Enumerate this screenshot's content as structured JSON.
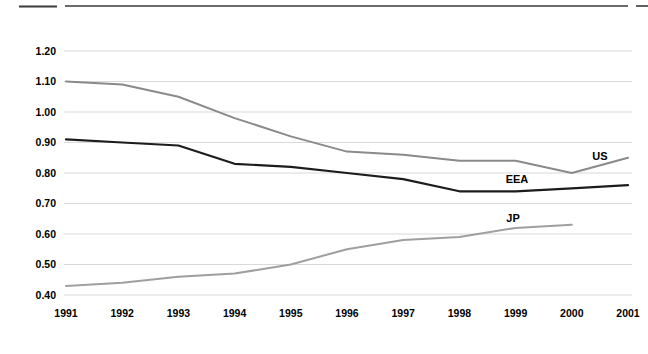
{
  "decor": {
    "rule_color": "#3a3a3a"
  },
  "chart_data": {
    "type": "line",
    "title": "",
    "xlabel": "",
    "ylabel": "",
    "x": [
      1991,
      1992,
      1993,
      1994,
      1995,
      1996,
      1997,
      1998,
      1999,
      2000,
      2001
    ],
    "xtick_labels": [
      "1991",
      "1992",
      "1993",
      "1994",
      "1995",
      "1996",
      "1997",
      "1998",
      "1999",
      "2000",
      "2001"
    ],
    "ylim": [
      0.4,
      1.2
    ],
    "ytick_step": 0.1,
    "ytick_labels": [
      "1.20",
      "1.10",
      "1.00",
      "0.90",
      "0.80",
      "0.70",
      "0.60",
      "0.50",
      "0.40"
    ],
    "grid": "horizontal-only",
    "legend": "inline-labels",
    "colors": {
      "gridline": "#d9d9d9",
      "tick_text": "#000000",
      "annotation_text": "#000000"
    },
    "series": [
      {
        "name": "US",
        "color": "#8a8a8a",
        "values": [
          1.1,
          1.09,
          1.05,
          0.98,
          0.92,
          0.87,
          0.86,
          0.84,
          0.84,
          0.8,
          0.85
        ]
      },
      {
        "name": "EEA",
        "color": "#1c1c1c",
        "values": [
          0.91,
          0.9,
          0.89,
          0.83,
          0.82,
          0.8,
          0.78,
          0.74,
          0.74,
          0.75,
          0.76
        ]
      },
      {
        "name": "JP",
        "color": "#9f9f9f",
        "values": [
          0.43,
          0.44,
          0.46,
          0.47,
          0.5,
          0.55,
          0.58,
          0.59,
          0.62,
          0.63,
          null
        ]
      }
    ],
    "annotations": [
      {
        "text": "US",
        "series": "US",
        "anchor_px": {
          "x": 600,
          "y": 160
        }
      },
      {
        "text": "EEA",
        "series": "EEA",
        "anchor_px": {
          "x": 517,
          "y": 183
        }
      },
      {
        "text": "JP",
        "series": "JP",
        "anchor_px": {
          "x": 513,
          "y": 222
        }
      }
    ]
  }
}
